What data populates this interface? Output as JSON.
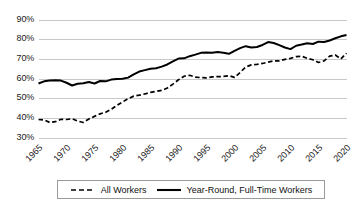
{
  "chart_data": {
    "type": "line",
    "title": "",
    "xlabel": "",
    "ylabel": "",
    "xlim": [
      1965,
      2020
    ],
    "ylim": [
      0.3,
      0.9
    ],
    "grid": true,
    "legend_position": "bottom",
    "y_tick_labels": [
      "90%",
      "80%",
      "70%",
      "60%",
      "50%",
      "40%",
      "30%"
    ],
    "y_tick_values": [
      0.9,
      0.8,
      0.7,
      0.6,
      0.5,
      0.4,
      0.3
    ],
    "x_tick_labels": [
      "1965",
      "1970",
      "1975",
      "1980",
      "1985",
      "1990",
      "1995",
      "2000",
      "2005",
      "2010",
      "2015",
      "2020"
    ],
    "x_tick_values": [
      1965,
      1970,
      1975,
      1980,
      1985,
      1990,
      1995,
      2000,
      2005,
      2010,
      2015,
      2020
    ],
    "x": [
      1965,
      1966,
      1967,
      1968,
      1969,
      1970,
      1971,
      1972,
      1973,
      1974,
      1975,
      1976,
      1977,
      1978,
      1979,
      1980,
      1981,
      1982,
      1983,
      1984,
      1985,
      1986,
      1987,
      1988,
      1989,
      1990,
      1991,
      1992,
      1993,
      1994,
      1995,
      1996,
      1997,
      1998,
      1999,
      2000,
      2001,
      2002,
      2003,
      2004,
      2005,
      2006,
      2007,
      2008,
      2009,
      2010,
      2011,
      2012,
      2013,
      2014,
      2015,
      2016,
      2017,
      2018,
      2019,
      2020
    ],
    "series": [
      {
        "name": "All Workers",
        "style": "dashed",
        "color": "#000000",
        "values": [
          0.394,
          0.392,
          0.379,
          0.383,
          0.395,
          0.394,
          0.398,
          0.386,
          0.379,
          0.397,
          0.41,
          0.423,
          0.431,
          0.446,
          0.466,
          0.483,
          0.5,
          0.513,
          0.518,
          0.524,
          0.532,
          0.537,
          0.542,
          0.554,
          0.574,
          0.596,
          0.614,
          0.619,
          0.61,
          0.607,
          0.606,
          0.611,
          0.612,
          0.613,
          0.617,
          0.608,
          0.633,
          0.661,
          0.672,
          0.674,
          0.679,
          0.686,
          0.692,
          0.692,
          0.7,
          0.705,
          0.714,
          0.716,
          0.705,
          0.698,
          0.684,
          0.692,
          0.716,
          0.722,
          0.702,
          0.731
        ]
      },
      {
        "name": "Year-Round, Full-Time Workers",
        "style": "solid",
        "color": "#000000",
        "values": [
          0.577,
          0.588,
          0.592,
          0.594,
          0.592,
          0.581,
          0.567,
          0.576,
          0.578,
          0.585,
          0.577,
          0.59,
          0.588,
          0.597,
          0.6,
          0.601,
          0.607,
          0.623,
          0.638,
          0.645,
          0.652,
          0.655,
          0.663,
          0.674,
          0.69,
          0.704,
          0.705,
          0.716,
          0.724,
          0.733,
          0.735,
          0.734,
          0.737,
          0.734,
          0.728,
          0.743,
          0.757,
          0.767,
          0.76,
          0.763,
          0.773,
          0.788,
          0.783,
          0.772,
          0.76,
          0.752,
          0.769,
          0.775,
          0.782,
          0.778,
          0.79,
          0.788,
          0.796,
          0.807,
          0.817,
          0.824
        ]
      }
    ],
    "legend": [
      {
        "label": "All Workers",
        "style": "dashed"
      },
      {
        "label": "Year-Round, Full-Time Workers",
        "style": "solid"
      }
    ]
  }
}
